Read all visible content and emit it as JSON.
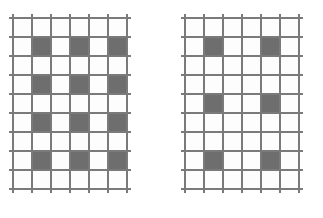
{
  "figure": {
    "background_color": "#ffffff",
    "width": 323,
    "height": 218,
    "caption": ""
  },
  "style": {
    "grid_line_color": "#7a7a7a",
    "filled_cell_color": "#6e6e6e",
    "empty_cell_color": "#fdfdfd",
    "grid_line_width": 1.1,
    "line_overhang": 4
  },
  "panels": [
    {
      "id": "left-grid",
      "name": "left-lattice-grid",
      "label": "",
      "x": 13,
      "y": 18,
      "columns": 6,
      "rows": 9,
      "cell_width": 19,
      "cell_height": 19,
      "filled_columns": [
        2,
        4,
        6
      ],
      "filled_rows": [
        2,
        4,
        6,
        8
      ],
      "filled_cells": [
        [
          2,
          2
        ],
        [
          2,
          4
        ],
        [
          2,
          6
        ],
        [
          4,
          2
        ],
        [
          4,
          4
        ],
        [
          4,
          6
        ],
        [
          6,
          2
        ],
        [
          6,
          4
        ],
        [
          6,
          6
        ],
        [
          8,
          2
        ],
        [
          8,
          4
        ],
        [
          8,
          6
        ]
      ],
      "filled_count": 12,
      "total_cells": 54
    },
    {
      "id": "right-grid",
      "name": "right-lattice-grid",
      "label": "",
      "x": 185,
      "y": 18,
      "columns": 6,
      "rows": 9,
      "cell_width": 19,
      "cell_height": 19,
      "filled_columns": [
        2,
        5
      ],
      "filled_rows": [
        2,
        5,
        8
      ],
      "filled_cells": [
        [
          2,
          2
        ],
        [
          2,
          5
        ],
        [
          5,
          2
        ],
        [
          5,
          5
        ],
        [
          8,
          2
        ],
        [
          8,
          5
        ]
      ],
      "filled_count": 6,
      "total_cells": 54
    }
  ]
}
